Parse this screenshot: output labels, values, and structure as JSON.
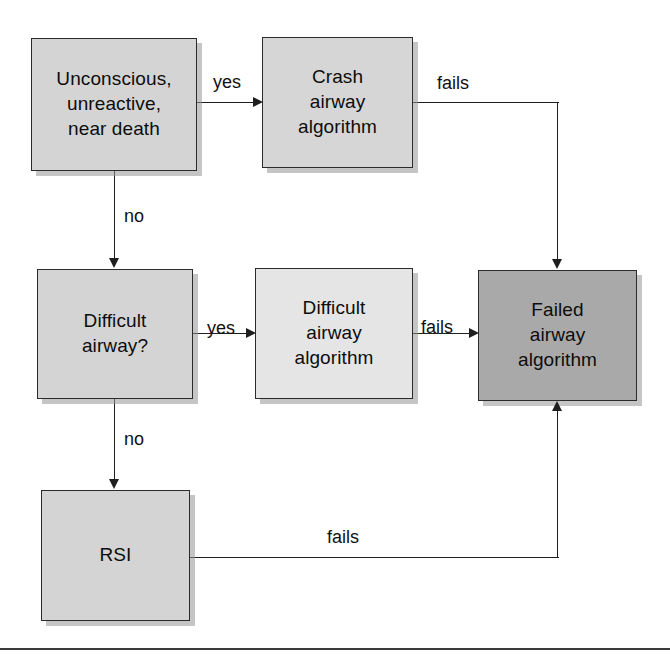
{
  "diagram": {
    "canvas": {
      "width": 670,
      "height": 657,
      "background": "#ffffff"
    },
    "nodes": [
      {
        "id": "unconscious",
        "label": "Unconscious,\nunreactive,\nnear death",
        "fill": "#d4d4d4",
        "border": "#2b2b2b",
        "x": 31,
        "y": 38,
        "w": 166,
        "h": 133
      },
      {
        "id": "crash-airway-algorithm",
        "label": "Crash\nairway\nalgorithm",
        "fill": "#d6d6d6",
        "border": "#2b2b2b",
        "x": 262,
        "y": 37,
        "w": 151,
        "h": 131
      },
      {
        "id": "difficult-airway-question",
        "label": "Difficult\nairway?",
        "fill": "#d4d4d4",
        "border": "#2b2b2b",
        "x": 37,
        "y": 269,
        "w": 156,
        "h": 130
      },
      {
        "id": "difficult-airway-algorithm",
        "label": "Difficult\nairway\nalgorithm",
        "fill": "#e5e5e5",
        "border": "#2b2b2b",
        "x": 255,
        "y": 268,
        "w": 158,
        "h": 131
      },
      {
        "id": "failed-airway-algorithm",
        "label": "Failed\nairway\nalgorithm",
        "fill": "#a9a9a9",
        "border": "#2b2b2b",
        "x": 478,
        "y": 270,
        "w": 159,
        "h": 131
      },
      {
        "id": "rsi",
        "label": "RSI",
        "fill": "#d4d4d4",
        "border": "#2b2b2b",
        "x": 41,
        "y": 490,
        "w": 149,
        "h": 131
      }
    ],
    "edge_labels": [
      {
        "id": "yes-crash",
        "text": "yes",
        "x": 213,
        "y": 72
      },
      {
        "id": "fails-crash",
        "text": "fails",
        "x": 437,
        "y": 73
      },
      {
        "id": "no-to-difficult",
        "text": "no",
        "x": 124,
        "y": 206
      },
      {
        "id": "yes-difficult",
        "text": "yes",
        "x": 207,
        "y": 318
      },
      {
        "id": "fails-difficult",
        "text": "fails",
        "x": 421,
        "y": 317
      },
      {
        "id": "no-to-rsi",
        "text": "no",
        "x": 124,
        "y": 429
      },
      {
        "id": "fails-rsi",
        "text": "fails",
        "x": 327,
        "y": 527
      }
    ],
    "edges": [
      {
        "id": "unconscious-to-crash",
        "from": "unconscious",
        "to": "crash-airway-algorithm",
        "label": "yes"
      },
      {
        "id": "crash-to-failed",
        "from": "crash-airway-algorithm",
        "to": "failed-airway-algorithm",
        "label": "fails"
      },
      {
        "id": "unconscious-to-difficult-question",
        "from": "unconscious",
        "to": "difficult-airway-question",
        "label": "no"
      },
      {
        "id": "difficult-question-to-difficult-algorithm",
        "from": "difficult-airway-question",
        "to": "difficult-airway-algorithm",
        "label": "yes"
      },
      {
        "id": "difficult-algorithm-to-failed",
        "from": "difficult-airway-algorithm",
        "to": "failed-airway-algorithm",
        "label": "fails"
      },
      {
        "id": "difficult-question-to-rsi",
        "from": "difficult-airway-question",
        "to": "rsi",
        "label": "no"
      },
      {
        "id": "rsi-to-failed",
        "from": "rsi",
        "to": "failed-airway-algorithm",
        "label": "fails"
      }
    ],
    "footer_rule": {
      "y": 648,
      "color": "#3a3a3a"
    }
  }
}
